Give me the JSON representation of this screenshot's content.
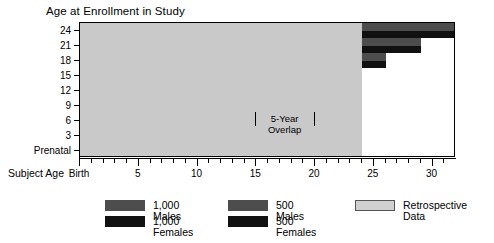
{
  "chart_data": {
    "type": "bar",
    "title": "Age at Enrollment in Study",
    "xlabel": "Subject Age",
    "ylabel": "Age at Enrollment in Study",
    "xlim": [
      0,
      32
    ],
    "ylim": [
      0,
      9
    ],
    "grid": false,
    "legend_position": "bottom",
    "x_ticks_major": [
      0,
      5,
      10,
      15,
      20,
      25,
      30
    ],
    "x_tick_labels": [
      "Birth",
      "5",
      "10",
      "15",
      "20",
      "25",
      "30"
    ],
    "x_ticks_minor": [
      1,
      2,
      3,
      4,
      6,
      7,
      8,
      9,
      11,
      12,
      13,
      14,
      16,
      17,
      18,
      19,
      21,
      22,
      23,
      24,
      26,
      27,
      28,
      29,
      31
    ],
    "y_tick_labels": [
      "24",
      "21",
      "18",
      "15",
      "12",
      "9",
      "6",
      "3",
      "Prenatal"
    ],
    "annotation": {
      "line1": "5-Year",
      "line2": "Overlap",
      "from_x": 15,
      "to_x": 20
    },
    "cohorts": [
      {
        "enrollment_age": "Prenatal",
        "row": 0,
        "retro_start": 0,
        "retro_end": 0,
        "male_start": 0,
        "male_end": 8,
        "female_start": 0,
        "female_end": 8
      },
      {
        "enrollment_age": "3",
        "row": 1,
        "retro_start": 0,
        "retro_end": 3,
        "male_start": 3,
        "male_end": 11,
        "female_start": 3,
        "female_end": 11
      },
      {
        "enrollment_age": "6",
        "row": 2,
        "retro_start": 0,
        "retro_end": 6,
        "male_start": 6,
        "male_end": 14,
        "female_start": 6,
        "female_end": 14
      },
      {
        "enrollment_age": "9",
        "row": 3,
        "retro_start": 0,
        "retro_end": 9,
        "male_start": 9,
        "male_end": 17,
        "female_start": 9,
        "female_end": 17
      },
      {
        "enrollment_age": "12",
        "row": 4,
        "retro_start": 0,
        "retro_end": 12,
        "male_start": 12,
        "male_end": 20,
        "female_start": 12,
        "female_end": 20
      },
      {
        "enrollment_age": "15",
        "row": 5,
        "retro_start": 0,
        "retro_end": 15,
        "male_start": 15,
        "male_end": 23,
        "female_start": 15,
        "female_end": 23
      },
      {
        "enrollment_age": "18",
        "row": 6,
        "retro_start": 0,
        "retro_end": 18,
        "male_start": 18,
        "male_end": 26,
        "female_start": 18,
        "female_end": 26
      },
      {
        "enrollment_age": "21",
        "row": 7,
        "retro_start": 0,
        "retro_end": 21,
        "male_start": 21,
        "male_end": 29,
        "female_start": 21,
        "female_end": 29
      },
      {
        "enrollment_age": "24",
        "row": 8,
        "retro_start": 0,
        "retro_end": 24,
        "male_start": 24,
        "male_end": 32,
        "female_start": 24,
        "female_end": 32
      }
    ],
    "legend": [
      {
        "key": "thousand-males",
        "label": "1,000 Males",
        "color": "#4d4d4d"
      },
      {
        "key": "thousand-females",
        "label": "1,000 Females",
        "color": "#111111"
      },
      {
        "key": "five-hundred-males",
        "label": "500 Males",
        "color": "#4d4d4d"
      },
      {
        "key": "five-hundred-females",
        "label": "500 Females",
        "color": "#111111"
      },
      {
        "key": "retrospective",
        "label": "Retrospective Data",
        "color": "#d0d0d0"
      }
    ]
  }
}
